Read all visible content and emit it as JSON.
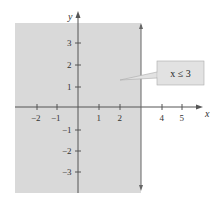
{
  "figure": {
    "inequality_label": "x ≤ 3",
    "x_axis_label": "x",
    "y_axis_label": "y",
    "x_ticks": [
      {
        "value": -2,
        "label": "−2"
      },
      {
        "value": -1,
        "label": "−1"
      },
      {
        "value": 1,
        "label": "1"
      },
      {
        "value": 2,
        "label": "2"
      },
      {
        "value": 4,
        "label": "4"
      },
      {
        "value": 5,
        "label": "5"
      }
    ],
    "y_ticks": [
      {
        "value": 3,
        "label": "3"
      },
      {
        "value": 2,
        "label": "2"
      },
      {
        "value": 1,
        "label": "1"
      },
      {
        "value": -1,
        "label": "−1"
      },
      {
        "value": -2,
        "label": "−2"
      },
      {
        "value": -3,
        "label": "−3"
      }
    ],
    "boundary_line": "x = 3",
    "colors": {
      "shading": "#d9d9d9",
      "axis": "#555555",
      "label_box": "#e2e2e2"
    }
  }
}
